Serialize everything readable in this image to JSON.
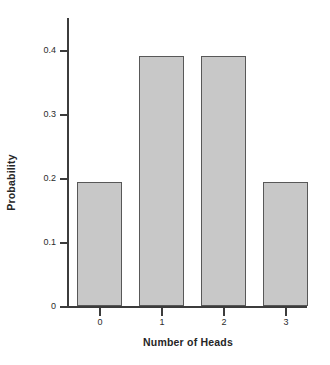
{
  "chart_data": {
    "type": "bar",
    "title": "",
    "subtitle": "",
    "xlabel": "Number of Heads",
    "ylabel": "Probability",
    "categories": [
      "0",
      "1",
      "2",
      "3"
    ],
    "values": [
      0.193,
      0.39,
      0.39,
      0.193
    ],
    "series": [
      {
        "name": "Probability",
        "values": [
          0.193,
          0.39,
          0.39,
          0.193
        ]
      }
    ],
    "xlim": [
      -0.5,
      3.5
    ],
    "ylim": [
      0,
      0.45
    ],
    "ytick_labels": [
      "0",
      "0.1",
      "0.2",
      "0.3",
      "0.4"
    ],
    "ytick_values": [
      0,
      0.1,
      0.2,
      0.3,
      0.4
    ],
    "xtick_labels": [
      "0",
      "1",
      "2",
      "3"
    ],
    "grid": false,
    "legend": false,
    "legend_position": "none",
    "annotations": [],
    "colors": {
      "bar_fill": "#c8c8c8",
      "bar_stroke": "#585858",
      "axis": "#3c3c3c",
      "text": "#2b2b2b",
      "background": "#ffffff"
    }
  }
}
